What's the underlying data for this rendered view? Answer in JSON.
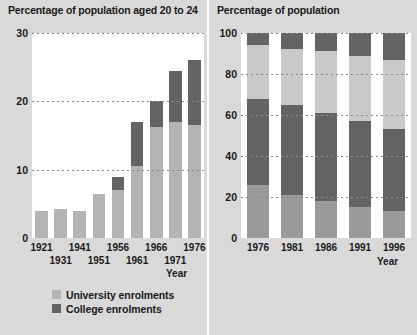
{
  "colors": {
    "panel_background": "#d9d9d9",
    "plot_background": "#ffffff",
    "divider": "#ffffff",
    "text": "#1a1a1a",
    "gridline": "#8a8a8a",
    "light_gray": "#b3b3b3",
    "dark_gray": "#636363",
    "mid_gray": "#9a9a9a",
    "pale_gray": "#c9c9c9"
  },
  "left": {
    "title": "Percentage of population aged 20 to 24",
    "axis_name": "Year",
    "yticks": [
      "0",
      "10",
      "20",
      "30"
    ],
    "xlabels": [
      "1921",
      "1931",
      "1941",
      "1951",
      "1956",
      "1961",
      "1966",
      "1971",
      "1976"
    ],
    "legend": [
      {
        "label": "University enrolments",
        "color": "#b3b3b3"
      },
      {
        "label": "College enrolments",
        "color": "#636363"
      }
    ]
  },
  "right": {
    "title": "Percentage of population",
    "axis_name": "Year",
    "yticks": [
      "0",
      "20",
      "40",
      "60",
      "80",
      "100"
    ],
    "xlabels": [
      "1976",
      "1981",
      "1986",
      "1991",
      "1996"
    ],
    "legend": [
      {
        "label": "University degree",
        "color": "#636363"
      },
      {
        "label": "Some post-secondary",
        "color": "#c9c9c9"
      },
      {
        "label": "Grades 9 to 13",
        "color": "#636363"
      },
      {
        "label": "Less than grade 9",
        "color": "#9a9a9a"
      }
    ]
  },
  "chart_data": [
    {
      "type": "bar",
      "title": "Percentage of population aged 20 to 24",
      "xlabel": "Year",
      "ylabel": "",
      "stacked": true,
      "grid": true,
      "legend_position": "bottom",
      "ylim": [
        0,
        30
      ],
      "yticks": [
        0,
        10,
        20,
        30
      ],
      "categories": [
        "1921",
        "1931",
        "1941",
        "1951",
        "1956",
        "1961",
        "1966",
        "1971",
        "1976"
      ],
      "series": [
        {
          "name": "University enrolments",
          "color": "#b3b3b3",
          "values": [
            4.0,
            4.2,
            4.0,
            6.5,
            7.0,
            10.5,
            16.3,
            17.0,
            16.5
          ]
        },
        {
          "name": "College enrolments",
          "color": "#636363",
          "values": [
            0,
            0,
            0,
            0,
            2.0,
            6.5,
            3.7,
            7.5,
            9.5
          ]
        }
      ],
      "totals": [
        4.0,
        4.2,
        4.0,
        6.5,
        9.0,
        17.0,
        20.0,
        24.5,
        26.0
      ]
    },
    {
      "type": "bar",
      "title": "Percentage of population",
      "xlabel": "Year",
      "ylabel": "",
      "stacked": true,
      "percent_stacked": true,
      "grid": true,
      "legend_position": "bottom",
      "ylim": [
        0,
        100
      ],
      "yticks": [
        0,
        20,
        40,
        60,
        80,
        100
      ],
      "categories": [
        "1976",
        "1981",
        "1986",
        "1991",
        "1996"
      ],
      "series": [
        {
          "name": "Less than grade 9",
          "color": "#9a9a9a",
          "values": [
            26,
            21,
            18,
            15,
            13
          ]
        },
        {
          "name": "Grades 9 to 13",
          "color": "#636363",
          "values": [
            42,
            44,
            43,
            42,
            40
          ]
        },
        {
          "name": "Some post-secondary",
          "color": "#c9c9c9",
          "values": [
            26,
            27,
            30,
            32,
            34
          ]
        },
        {
          "name": "University degree",
          "color": "#636363",
          "values": [
            6,
            8,
            9,
            11,
            13
          ]
        }
      ]
    }
  ]
}
